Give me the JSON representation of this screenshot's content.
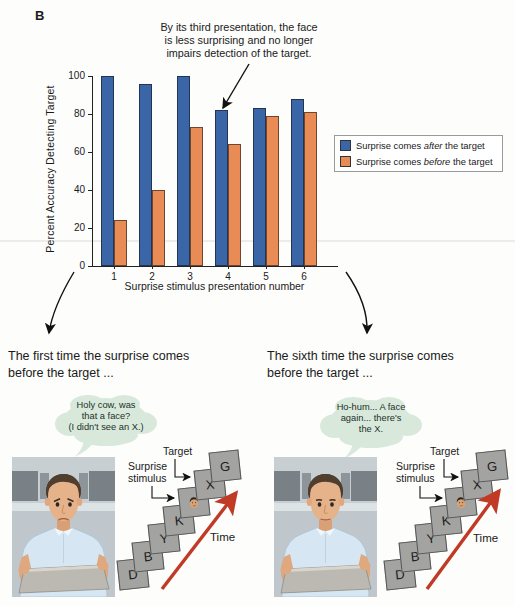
{
  "figure_label": "B",
  "annotation": {
    "text": "By its third presentation, the face\nis less surprising and no longer\nimpairs detection of the target."
  },
  "chart_data": {
    "type": "bar",
    "title": "",
    "xlabel": "Surprise stimulus presentation number",
    "ylabel": "Percent Accuracy Detecting Target",
    "categories": [
      "1",
      "2",
      "3",
      "4",
      "5",
      "6"
    ],
    "series": [
      {
        "name": "Surprise comes after the target",
        "values": [
          100,
          96,
          100,
          82,
          83,
          88
        ],
        "color": "#3a66a7"
      },
      {
        "name": "Surprise comes before the target",
        "values": [
          24,
          40,
          73,
          64,
          79,
          81
        ],
        "color": "#e88b54"
      }
    ],
    "ylim": [
      0,
      100
    ],
    "yticks": [
      0,
      20,
      40,
      60,
      80,
      100
    ],
    "grid": false,
    "legend_position": "right"
  },
  "legend": {
    "items": [
      {
        "pre": "Surprise comes ",
        "italic": "after",
        "post": " the target",
        "color": "#3a66a7"
      },
      {
        "pre": "Surprise comes ",
        "italic": "before",
        "post": " the target",
        "color": "#e88b54"
      }
    ]
  },
  "panels": {
    "left": {
      "heading": "The first time the surprise comes\nbefore the target ...",
      "bubble": "Holy cow, was\nthat a face?\n(I didn't see an X.)"
    },
    "right": {
      "heading": "The sixth time the surprise comes\nbefore the target ...",
      "bubble": "Ho-hum... A face\nagain... there's\nthe X."
    }
  },
  "stack": {
    "letters": [
      "D",
      "B",
      "Y",
      "K",
      "",
      "X",
      "G"
    ],
    "face_index": 4,
    "target_label": "Target",
    "surprise_label": "Surprise\nstimulus",
    "time_label": "Time"
  },
  "colors": {
    "bar_after": "#3a66a7",
    "bar_before": "#e88b54",
    "time_arrow": "#c03a25",
    "card": "#a3a3a1",
    "bubble": "#d8e9db"
  }
}
